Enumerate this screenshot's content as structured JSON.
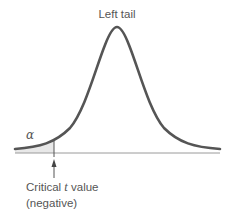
{
  "diagram": {
    "title": "Left tail",
    "alpha_symbol": "α",
    "critical_label_prefix": "Critical ",
    "critical_label_var": "t",
    "critical_label_suffix": " value",
    "critical_label_note": "(negative)",
    "curve_color": "#555555",
    "axis_color": "#999999",
    "shade_color": "#e6e6e6"
  }
}
